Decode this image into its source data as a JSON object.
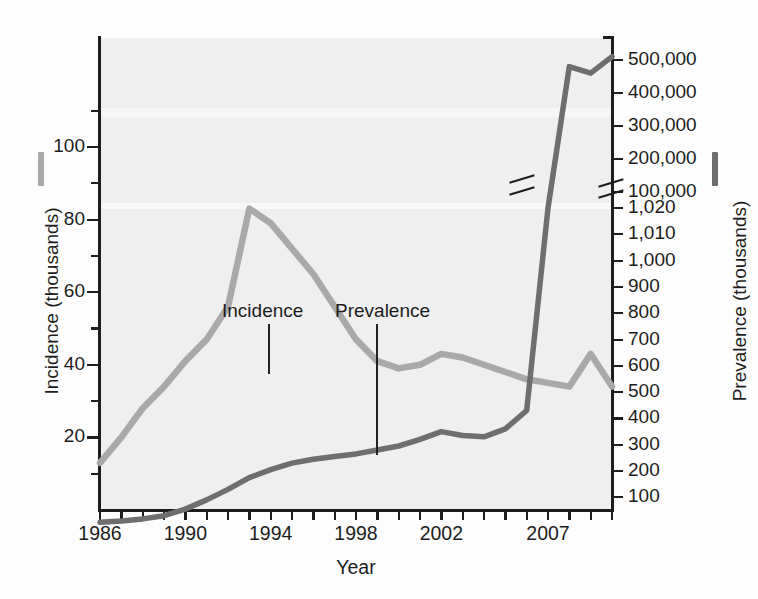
{
  "chart_data": {
    "type": "line",
    "title": "",
    "xlabel": "Year",
    "ylabel_left": "Incidence (thousands)",
    "ylabel_right": "Prevalence (thousands)",
    "grid": false,
    "legend_position": "inline-annotations",
    "x": [
      1986,
      1987,
      1988,
      1989,
      1990,
      1991,
      1992,
      1993,
      1994,
      1995,
      1996,
      1997,
      1998,
      1999,
      2000,
      2001,
      2002,
      2003,
      2004,
      2005,
      2006,
      2007,
      2008,
      2009,
      2010
    ],
    "xlim": [
      1986,
      2010
    ],
    "xticks": [
      1986,
      1987,
      1988,
      1989,
      1990,
      1991,
      1992,
      1993,
      1994,
      1995,
      1996,
      1997,
      1998,
      1999,
      2000,
      2001,
      2002,
      2003,
      2004,
      2005,
      2006,
      2007,
      2008,
      2009,
      2010
    ],
    "xtick_labels": [
      "1986",
      "1990",
      "1994",
      "1998",
      "2002",
      "2007"
    ],
    "xtick_label_years": [
      1986,
      1990,
      1994,
      1998,
      2002,
      2007
    ],
    "left_axis": {
      "label": "Incidence (thousands)",
      "ticks_major": [
        20,
        40,
        60,
        80,
        100
      ],
      "ticks_major_labels": [
        "20",
        "40",
        "60",
        "80",
        "100"
      ],
      "ticks_minor": [
        10,
        30,
        50,
        70,
        90,
        110
      ],
      "range": [
        0,
        130
      ],
      "color": "#a9a9a9"
    },
    "right_axis": {
      "label": "Prevalence (thousands)",
      "ticks_labels": [
        "500,000",
        "400,000",
        "300,000",
        "200,000",
        "100,000",
        "1,020",
        "1,010",
        "1,000",
        "900",
        "800",
        "700",
        "600",
        "500",
        "400",
        "300",
        "200",
        "100"
      ],
      "break_between": [
        "100,000",
        "1,020"
      ],
      "has_axis_break": true,
      "color": "#6e6e6e"
    },
    "series": [
      {
        "name": "Incidence",
        "axis": "left",
        "units": "thousands",
        "color": "#a9a9a9",
        "values": [
          13,
          20,
          28,
          34,
          41,
          47,
          56,
          83,
          79,
          72,
          65,
          56,
          47,
          41,
          39,
          40,
          43,
          42,
          40,
          38,
          36,
          35,
          34,
          43,
          34
        ]
      },
      {
        "name": "Prevalence",
        "axis": "right",
        "units": "thousands",
        "color": "#6e6e6e",
        "values": [
          5,
          10,
          18,
          30,
          55,
          90,
          130,
          175,
          205,
          230,
          245,
          255,
          265,
          280,
          295,
          320,
          350,
          335,
          330,
          360,
          430,
          1020,
          480000,
          460000,
          510000
        ],
        "note": "right axis is broken between 1,020 and 100,000"
      }
    ],
    "annotations": [
      {
        "text": "Incidence",
        "points_to": "incidence-curve"
      },
      {
        "text": "Prevalence",
        "points_to": "prevalence-curve"
      }
    ]
  },
  "left_tick_labels": [
    "100",
    "80",
    "60",
    "40",
    "20"
  ],
  "right_tick_labels": [
    "500,000",
    "400,000",
    "300,000",
    "200,000",
    "100,000",
    "1,020",
    "1,010",
    "1,000",
    "900",
    "800",
    "700",
    "600",
    "500",
    "400",
    "300",
    "200",
    "100"
  ],
  "x_tick_labels": [
    "1986",
    "1990",
    "1994",
    "1998",
    "2002",
    "2007"
  ],
  "titles": {
    "x_axis": "Year",
    "y_axis_left": "Incidence (thousands)",
    "y_axis_right": "Prevalence (thousands)"
  },
  "annotations": {
    "incidence": "Incidence",
    "prevalence": "Prevalence"
  },
  "colors": {
    "incidence_line": "#a9a9a9",
    "prevalence_line": "#6e6e6e",
    "plot_background": "#efefef",
    "axis": "#1d1d1d"
  }
}
